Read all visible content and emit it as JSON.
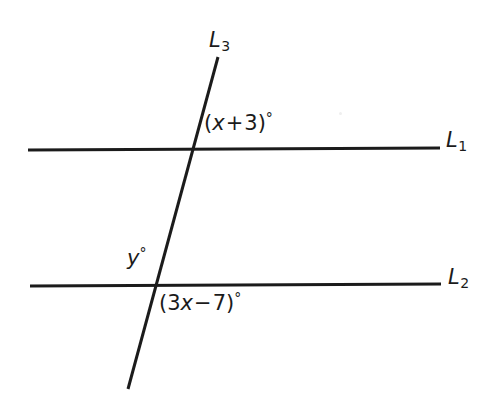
{
  "figure": {
    "type": "geometry-diagram",
    "background_color": "#ffffff",
    "stroke_color": "#1b1b1b",
    "text_color": "#1b1b1b"
  },
  "lines": {
    "l1": {
      "name": "L",
      "subscript": "1",
      "x1": 28,
      "y1": 150,
      "x2": 440,
      "y2": 148,
      "stroke_width": 3
    },
    "l2": {
      "name": "L",
      "subscript": "2",
      "x1": 30,
      "y1": 286,
      "x2": 441,
      "y2": 284,
      "stroke_width": 3
    },
    "l3": {
      "name": "L",
      "subscript": "3",
      "x1": 218,
      "y1": 57,
      "x2": 128,
      "y2": 389,
      "stroke_width": 3
    }
  },
  "angles": {
    "upper": {
      "open_paren": "(",
      "variable": "x",
      "operator": "+",
      "constant": "3",
      "close_paren": ")",
      "degree": "°",
      "full_text": "(x + 3)°"
    },
    "lower_left": {
      "variable": "y",
      "degree": "°",
      "full_text": "y°"
    },
    "lower_right": {
      "open_paren": "(",
      "coefficient": "3",
      "variable": "x",
      "operator": "−",
      "constant": "7",
      "close_paren": ")",
      "degree": "°",
      "full_text": "(3x − 7)°"
    }
  },
  "intersections": {
    "with_l1": {
      "x": 193,
      "y": 149
    },
    "with_l2": {
      "x": 163,
      "y": 285
    }
  }
}
